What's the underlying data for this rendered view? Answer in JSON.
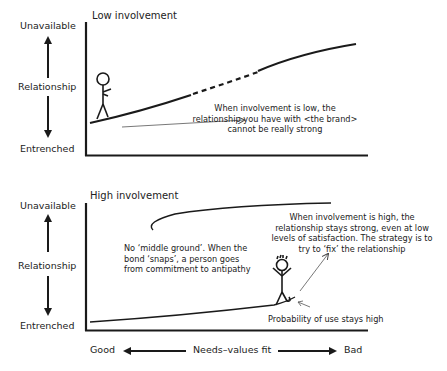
{
  "top_chart": {
    "title": "Low involvement",
    "y_axis": {
      "top": "Unavailable",
      "middle": "Relationship",
      "bottom": "Entrenched"
    },
    "annotation": {
      "line1": "When involvement is low, the",
      "line2": "relationship you have with <the brand>",
      "line3": "cannot be really strong"
    }
  },
  "bottom_chart": {
    "title": "High involvement",
    "y_axis": {
      "top": "Unavailable",
      "middle": "Relationship",
      "bottom": "Entrenched"
    },
    "annotation_left": {
      "line1": "No ‘middle ground’. When the",
      "line2": "bond ‘snaps’, a person goes",
      "line3": "from commitment to antipathy"
    },
    "annotation_right": {
      "line1": "When involvement is high, the",
      "line2": "relationship stays strong, even at low",
      "line3": "levels of satisfaction. The strategy is to",
      "line4": "try to ‘fix’ the relationship"
    },
    "annotation_bottom": "Probability of use stays high",
    "x_axis": {
      "left": "Good",
      "middle": "Needs–values fit",
      "right": "Bad"
    }
  },
  "colors": {
    "ink": "#1a1a1a",
    "thin_line": "#555555",
    "background": "#ffffff"
  }
}
